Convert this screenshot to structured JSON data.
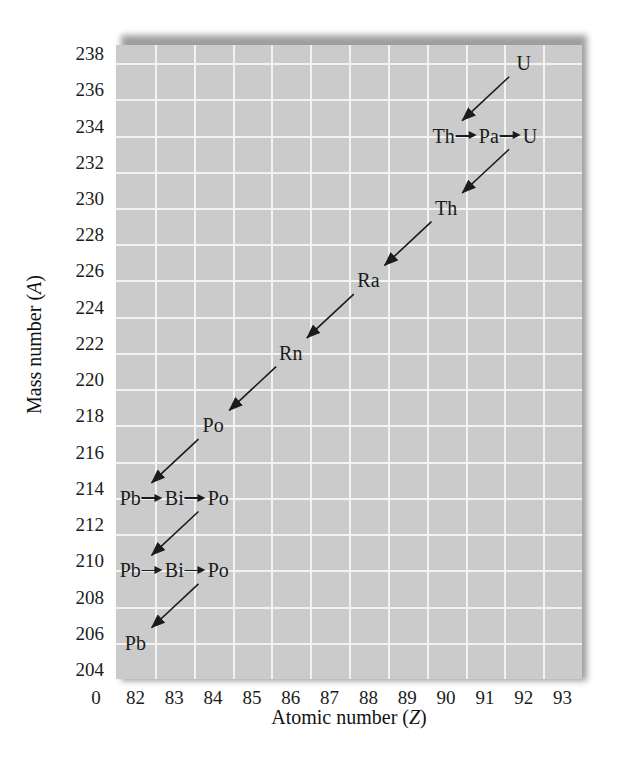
{
  "figure": {
    "caption": "",
    "colors": {
      "plot_background": "#cbcbcb",
      "gridline": "#f2f2f2",
      "text": "#1b1b1b",
      "arrow": "#1b1b1b",
      "shadow": "#8e8e8e"
    }
  },
  "axes": {
    "x": {
      "title_main": "Atomic number (",
      "title_var": "Z",
      "title_close": ")",
      "ticks": [
        "0",
        "82",
        "83",
        "84",
        "85",
        "86",
        "87",
        "88",
        "89",
        "90",
        "91",
        "92",
        "93"
      ],
      "origin_break_label": "0",
      "min": 81.5,
      "max": 93.5
    },
    "y": {
      "title_main": "Mass number (",
      "title_var": "A",
      "title_close": ")",
      "ticks": [
        "238",
        "236",
        "234",
        "232",
        "230",
        "228",
        "226",
        "224",
        "222",
        "220",
        "218",
        "216",
        "214",
        "212",
        "210",
        "208",
        "206",
        "204"
      ],
      "min": 204,
      "max": 239
    }
  },
  "chart_data": {
    "type": "scatter",
    "xlabel": "Atomic number (Z)",
    "ylabel": "Mass number (A)",
    "xlim": [
      81.5,
      93.5
    ],
    "ylim": [
      204,
      239
    ],
    "grid": true,
    "legend": null,
    "rows": [
      {
        "mass_number": 238,
        "y": 238,
        "x_center": 92,
        "members": [
          {
            "symbol": "U",
            "z": 92
          }
        ],
        "label": "U"
      },
      {
        "mass_number": 234,
        "y": 234,
        "x_center": 91,
        "members": [
          {
            "symbol": "Th",
            "z": 90
          },
          {
            "symbol": "Pa",
            "z": 91
          },
          {
            "symbol": "U",
            "z": 92
          }
        ],
        "label": "Th→Pa→U"
      },
      {
        "mass_number": 230,
        "y": 230,
        "x_center": 90,
        "members": [
          {
            "symbol": "Th",
            "z": 90
          }
        ],
        "label": "Th"
      },
      {
        "mass_number": 226,
        "y": 226,
        "x_center": 88,
        "members": [
          {
            "symbol": "Ra",
            "z": 88
          }
        ],
        "label": "Ra"
      },
      {
        "mass_number": 222,
        "y": 222,
        "x_center": 86,
        "members": [
          {
            "symbol": "Rn",
            "z": 86
          }
        ],
        "label": "Rn"
      },
      {
        "mass_number": 218,
        "y": 218,
        "x_center": 84,
        "members": [
          {
            "symbol": "Po",
            "z": 84
          }
        ],
        "label": "Po"
      },
      {
        "mass_number": 214,
        "y": 214,
        "x_center": 83,
        "members": [
          {
            "symbol": "Pb",
            "z": 82
          },
          {
            "symbol": "Bi",
            "z": 83
          },
          {
            "symbol": "Po",
            "z": 84
          }
        ],
        "label": "Pb→Bi→Po"
      },
      {
        "mass_number": 210,
        "y": 210,
        "x_center": 83,
        "members": [
          {
            "symbol": "Pb",
            "z": 82
          },
          {
            "symbol": "Bi",
            "z": 83
          },
          {
            "symbol": "Po",
            "z": 84
          }
        ],
        "label": "Pb→Bi→Po"
      },
      {
        "mass_number": 206,
        "y": 206,
        "x_center": 82,
        "members": [
          {
            "symbol": "Pb",
            "z": 82
          }
        ],
        "label": "Pb"
      }
    ],
    "alpha_decays": [
      {
        "from": {
          "z": 92,
          "a": 238
        },
        "to": {
          "z": 90,
          "a": 234
        }
      },
      {
        "from": {
          "z": 92,
          "a": 234
        },
        "to": {
          "z": 90,
          "a": 230
        }
      },
      {
        "from": {
          "z": 90,
          "a": 230
        },
        "to": {
          "z": 88,
          "a": 226
        }
      },
      {
        "from": {
          "z": 88,
          "a": 226
        },
        "to": {
          "z": 86,
          "a": 222
        }
      },
      {
        "from": {
          "z": 86,
          "a": 222
        },
        "to": {
          "z": 84,
          "a": 218
        }
      },
      {
        "from": {
          "z": 84,
          "a": 218
        },
        "to": {
          "z": 82,
          "a": 214
        }
      },
      {
        "from": {
          "z": 84,
          "a": 214
        },
        "to": {
          "z": 82,
          "a": 210
        }
      },
      {
        "from": {
          "z": 84,
          "a": 210
        },
        "to": {
          "z": 82,
          "a": 206
        }
      }
    ],
    "beta_decays": [
      {
        "from": {
          "z": 90,
          "a": 234
        },
        "to": {
          "z": 91,
          "a": 234
        }
      },
      {
        "from": {
          "z": 91,
          "a": 234
        },
        "to": {
          "z": 92,
          "a": 234
        }
      },
      {
        "from": {
          "z": 82,
          "a": 214
        },
        "to": {
          "z": 83,
          "a": 214
        }
      },
      {
        "from": {
          "z": 83,
          "a": 214
        },
        "to": {
          "z": 84,
          "a": 214
        }
      },
      {
        "from": {
          "z": 82,
          "a": 210
        },
        "to": {
          "z": 83,
          "a": 210
        }
      },
      {
        "from": {
          "z": 83,
          "a": 210
        },
        "to": {
          "z": 84,
          "a": 210
        }
      }
    ]
  }
}
